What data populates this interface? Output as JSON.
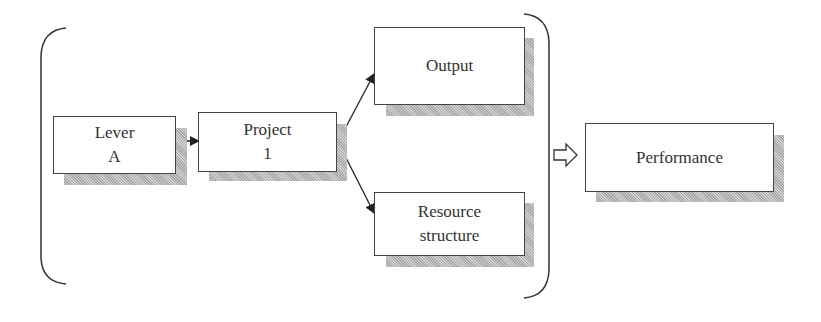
{
  "diagram": {
    "nodes": [
      {
        "id": "lever",
        "lines": [
          "Lever",
          "A"
        ]
      },
      {
        "id": "project",
        "lines": [
          "Project",
          "1"
        ]
      },
      {
        "id": "output",
        "lines": [
          "Output"
        ]
      },
      {
        "id": "resource",
        "lines": [
          "Resource",
          "structure"
        ]
      },
      {
        "id": "performance",
        "lines": [
          "Performance"
        ]
      }
    ],
    "edges": [
      {
        "from": "lever",
        "to": "project",
        "style": "solid-arrow"
      },
      {
        "from": "project",
        "to": "output",
        "style": "solid-arrow"
      },
      {
        "from": "project",
        "to": "resource",
        "style": "solid-arrow"
      },
      {
        "from": "bracket-group",
        "to": "performance",
        "style": "hollow-block-arrow"
      }
    ],
    "groups": [
      {
        "id": "bracket-group",
        "members": [
          "lever",
          "project",
          "output",
          "resource"
        ],
        "style": "parentheses"
      }
    ]
  }
}
